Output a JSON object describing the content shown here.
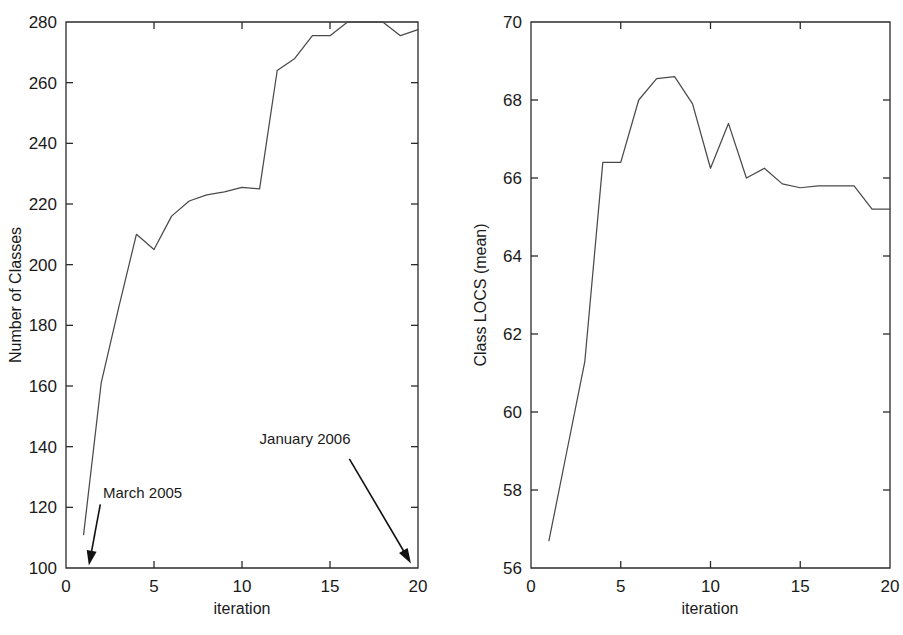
{
  "figure": {
    "background": "#ffffff",
    "line_color": "#4a4a4a",
    "axis_color": "#2b2b2b",
    "text_color": "#1a1a1a"
  },
  "chart_data": [
    {
      "type": "line",
      "panel": "left",
      "title": "",
      "xlabel": "iteration",
      "ylabel": "Number of Classes",
      "xlim": [
        0,
        20
      ],
      "ylim": [
        100,
        280
      ],
      "xticks": [
        0,
        5,
        10,
        15,
        20
      ],
      "xtick_labels": [
        "0",
        "5",
        "10",
        "15",
        "20"
      ],
      "yticks": [
        100,
        120,
        140,
        160,
        180,
        200,
        220,
        240,
        260,
        280
      ],
      "ytick_labels": [
        "100",
        "120",
        "140",
        "160",
        "180",
        "200",
        "220",
        "240",
        "260",
        "280"
      ],
      "grid": false,
      "legend": "none",
      "x": [
        1,
        2,
        3,
        4,
        5,
        6,
        7,
        8,
        9,
        10,
        11,
        12,
        13,
        14,
        15,
        16,
        17,
        18,
        19,
        20
      ],
      "values": [
        111,
        161,
        186,
        210,
        205,
        216,
        221,
        223,
        224,
        225.5,
        225,
        264,
        268,
        275.5,
        275.5,
        280,
        281,
        280.5,
        275.5,
        277.5
      ],
      "annotations": [
        {
          "text": "March 2005",
          "text_x": 2.1,
          "text_y": 123,
          "arrow_from_x": 1.95,
          "arrow_from_y": 121,
          "arrow_to_x": 1.3,
          "arrow_to_y": 100.8
        },
        {
          "text": "January 2006",
          "text_x": 11.0,
          "text_y": 141,
          "arrow_from_x": 16.1,
          "arrow_from_y": 136,
          "arrow_to_x": 19.6,
          "arrow_to_y": 101.5
        }
      ]
    },
    {
      "type": "line",
      "panel": "right",
      "title": "",
      "xlabel": "iteration",
      "ylabel": "Class LOCS (mean)",
      "xlim": [
        0,
        20
      ],
      "ylim": [
        56,
        70
      ],
      "xticks": [
        0,
        5,
        10,
        15,
        20
      ],
      "xtick_labels": [
        "0",
        "5",
        "10",
        "15",
        "20"
      ],
      "yticks": [
        56,
        58,
        60,
        62,
        64,
        66,
        68,
        70
      ],
      "ytick_labels": [
        "56",
        "58",
        "60",
        "62",
        "64",
        "66",
        "68",
        "70"
      ],
      "grid": false,
      "legend": "none",
      "x": [
        1,
        2,
        3,
        4,
        5,
        6,
        7,
        8,
        9,
        10,
        11,
        12,
        13,
        14,
        15,
        16,
        17,
        18,
        19,
        20
      ],
      "values": [
        56.7,
        59.0,
        61.3,
        66.4,
        66.4,
        68.0,
        68.55,
        68.6,
        67.9,
        66.25,
        67.4,
        66.0,
        66.25,
        65.85,
        65.75,
        65.8,
        65.8,
        65.8,
        65.2,
        65.2
      ]
    }
  ]
}
